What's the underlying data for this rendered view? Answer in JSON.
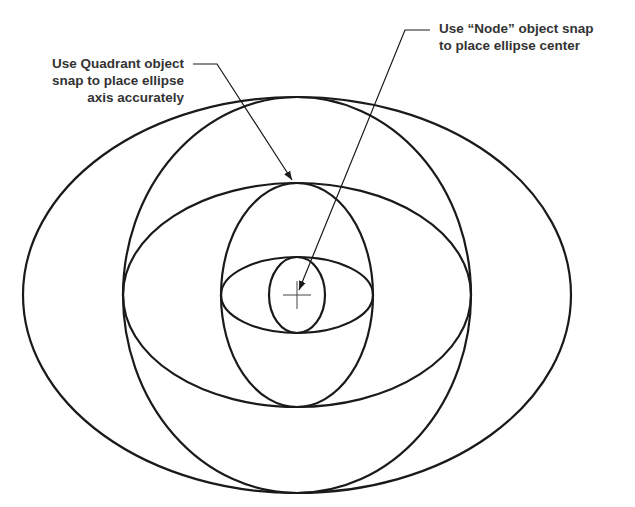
{
  "callouts": {
    "quadrant": {
      "lines": [
        "Use Quadrant object",
        "snap to place ellipse",
        "axis accurately"
      ]
    },
    "node": {
      "lines": [
        "Use “Node” object snap",
        "to place ellipse center"
      ]
    }
  },
  "drawing": {
    "center": {
      "x": 297,
      "y": 295
    },
    "stroke_color": "#1a1a1a",
    "text_color": "#333333",
    "ellipses": [
      {
        "name": "outer-wide-ellipse",
        "rx": 274,
        "ry": 198
      },
      {
        "name": "large-tall-ellipse",
        "rx": 174,
        "ry": 198
      },
      {
        "name": "medium-wide-ellipse",
        "rx": 174,
        "ry": 112
      },
      {
        "name": "medium-tall-ellipse",
        "rx": 76,
        "ry": 112
      },
      {
        "name": "small-wide-ellipse",
        "rx": 76,
        "ry": 38
      },
      {
        "name": "small-tall-ellipse",
        "rx": 28,
        "ry": 38
      }
    ],
    "center_mark": {
      "half_length": 14
    },
    "leaders": {
      "quadrant": {
        "points": [
          [
            193,
            64
          ],
          [
            217,
            64
          ],
          [
            292,
            180
          ]
        ]
      },
      "node": {
        "points": [
          [
            430,
            30
          ],
          [
            405,
            30
          ],
          [
            299,
            290
          ]
        ]
      }
    }
  }
}
